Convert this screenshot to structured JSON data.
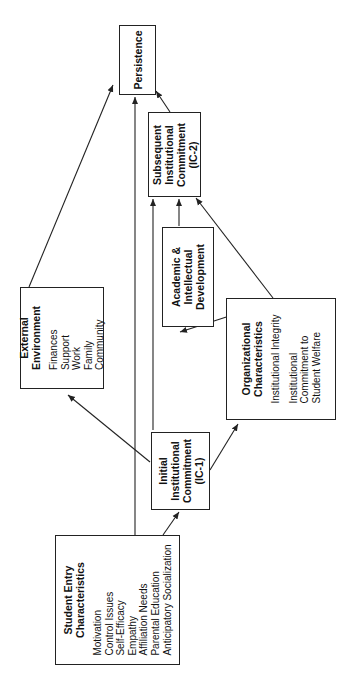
{
  "diagram": {
    "orientation": "rotated-90-ccw",
    "nodes": {
      "persistence": {
        "title": [
          "Persistence"
        ]
      },
      "subsequent_ic": {
        "title": [
          "Subsequent",
          "Institutional",
          "Commitment",
          "(IC-2)"
        ]
      },
      "academic": {
        "title": [
          "Academic &",
          "Intellectual",
          "Development"
        ]
      },
      "organizational": {
        "title": [
          "Organizational",
          "Characteristics"
        ],
        "items": [
          "Institutional Integrity",
          "Institutional",
          "Commitment to",
          "Student Welfare"
        ]
      },
      "external": {
        "title": [
          "External",
          "Environment"
        ],
        "items": [
          "Finances",
          "Support",
          "Work",
          "Family",
          "Community"
        ]
      },
      "initial_ic": {
        "title": [
          "Initial",
          "Institutional",
          "Commitment",
          "(IC-1)"
        ]
      },
      "student_entry": {
        "title": [
          "Student Entry",
          "Characteristics"
        ],
        "items": [
          "Motivation",
          "Control Issues",
          "Self-Efficacy",
          "Empathy",
          "Affiliation Needs",
          "Parental Education",
          "Anticipatory Socialization"
        ]
      }
    },
    "edges": [
      {
        "from": "Student Entry Characteristics",
        "to": "Initial Institutional Commitment (IC-1)"
      },
      {
        "from": "Student Entry Characteristics",
        "to": "Persistence"
      },
      {
        "from": "Initial Institutional Commitment (IC-1)",
        "to": "External Environment"
      },
      {
        "from": "Initial Institutional Commitment (IC-1)",
        "to": "Organizational Characteristics"
      },
      {
        "from": "Initial Institutional Commitment (IC-1)",
        "to": "Subsequent Institutional Commitment (IC-2)"
      },
      {
        "from": "Organizational Characteristics",
        "to": "Academic & Intellectual Development"
      },
      {
        "from": "Organizational Characteristics",
        "to": "Subsequent Institutional Commitment (IC-2)"
      },
      {
        "from": "Academic & Intellectual Development",
        "to": "Subsequent Institutional Commitment (IC-2)"
      },
      {
        "from": "Subsequent Institutional Commitment (IC-2)",
        "to": "Persistence"
      },
      {
        "from": "External Environment",
        "to": "Persistence"
      }
    ],
    "colors": {
      "line": "#222222",
      "background": "#ffffff"
    }
  }
}
